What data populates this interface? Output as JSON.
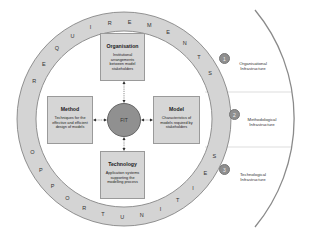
{
  "ring": {
    "top_label": "REQUIREMENTS",
    "bottom_label": "OPPORTUNITIES",
    "top_letters": [
      "R",
      "E",
      "Q",
      "U",
      "I",
      "R",
      "E",
      "M",
      "E",
      "N",
      "T",
      "S"
    ],
    "bottom_letters": [
      "O",
      "P",
      "P",
      "O",
      "R",
      "T",
      "U",
      "N",
      "I",
      "T",
      "I",
      "E",
      "S"
    ],
    "fill_color": "#d4d4d4"
  },
  "center": {
    "label": "FIT",
    "color": "#909090"
  },
  "boxes": {
    "organisation": {
      "title": "Organisation",
      "description": "Institutional arrangements between model stakeholders"
    },
    "method": {
      "title": "Method",
      "description": "Techniques for the effective and efficient design of models"
    },
    "model": {
      "title": "Model",
      "description": "Characteristics of models required by stakeholders"
    },
    "technology": {
      "title": "Technology",
      "description": "Application systems supporting the modelling process"
    }
  },
  "infrastructures": [
    {
      "number": "1",
      "label_line1": "Organisational",
      "label_line2": "Infrastructure"
    },
    {
      "number": "2",
      "label_line1": "Methodological",
      "label_line2": "Infrastructure"
    },
    {
      "number": "3",
      "label_line1": "Technological",
      "label_line2": "Infrastructure"
    }
  ]
}
